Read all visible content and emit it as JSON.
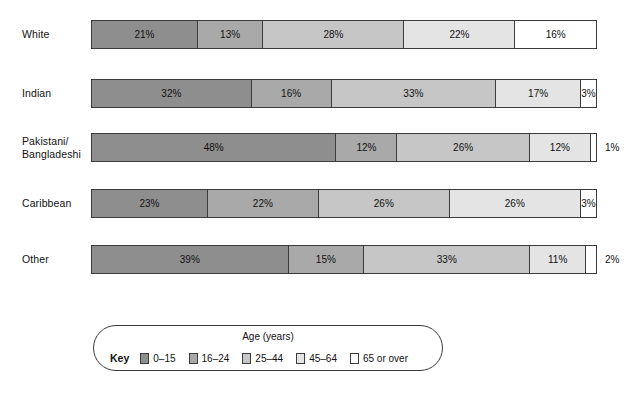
{
  "chart_data": {
    "type": "bar",
    "subtype": "100% stacked horizontal bar",
    "title": "",
    "xlabel": "",
    "ylabel": "",
    "xlim": [
      0,
      100
    ],
    "grid": false,
    "legend_position": "bottom",
    "categories": [
      "White",
      "Indian",
      "Pakistani/ Bangladeshi",
      "Caribbean",
      "Other"
    ],
    "series": [
      {
        "name": "0–15",
        "values": [
          21,
          32,
          48,
          23,
          39
        ]
      },
      {
        "name": "16–24",
        "values": [
          13,
          16,
          12,
          22,
          15
        ]
      },
      {
        "name": "25–44",
        "values": [
          28,
          33,
          26,
          26,
          33
        ]
      },
      {
        "name": "45–64",
        "values": [
          22,
          17,
          12,
          26,
          11
        ]
      },
      {
        "name": "65 or over",
        "values": [
          16,
          3,
          1,
          3,
          2
        ]
      }
    ],
    "colors": [
      "#8e8e8e",
      "#a9a9a9",
      "#c6c6c6",
      "#e4e4e4",
      "#ffffff"
    ]
  },
  "rows": [
    {
      "label_lines": [
        "White"
      ],
      "segments": [
        {
          "value": 21,
          "text": "21%",
          "shade": 0,
          "label_outside": false
        },
        {
          "value": 13,
          "text": "13%",
          "shade": 1,
          "label_outside": false
        },
        {
          "value": 28,
          "text": "28%",
          "shade": 2,
          "label_outside": false
        },
        {
          "value": 22,
          "text": "22%",
          "shade": 3,
          "label_outside": false
        },
        {
          "value": 16,
          "text": "16%",
          "shade": 4,
          "label_outside": false
        }
      ]
    },
    {
      "label_lines": [
        "Indian"
      ],
      "segments": [
        {
          "value": 32,
          "text": "32%",
          "shade": 0,
          "label_outside": false
        },
        {
          "value": 16,
          "text": "16%",
          "shade": 1,
          "label_outside": false
        },
        {
          "value": 33,
          "text": "33%",
          "shade": 2,
          "label_outside": false
        },
        {
          "value": 17,
          "text": "17%",
          "shade": 3,
          "label_outside": false
        },
        {
          "value": 3,
          "text": "3%",
          "shade": 4,
          "label_outside": false
        }
      ]
    },
    {
      "label_lines": [
        "Pakistani/",
        "Bangladeshi"
      ],
      "segments": [
        {
          "value": 48,
          "text": "48%",
          "shade": 0,
          "label_outside": false
        },
        {
          "value": 12,
          "text": "12%",
          "shade": 1,
          "label_outside": false
        },
        {
          "value": 26,
          "text": "26%",
          "shade": 2,
          "label_outside": false
        },
        {
          "value": 12,
          "text": "12%",
          "shade": 3,
          "label_outside": false
        },
        {
          "value": 1,
          "text": "1%",
          "shade": 4,
          "label_outside": true
        }
      ]
    },
    {
      "label_lines": [
        "Caribbean"
      ],
      "segments": [
        {
          "value": 23,
          "text": "23%",
          "shade": 0,
          "label_outside": false
        },
        {
          "value": 22,
          "text": "22%",
          "shade": 1,
          "label_outside": false
        },
        {
          "value": 26,
          "text": "26%",
          "shade": 2,
          "label_outside": false
        },
        {
          "value": 26,
          "text": "26%",
          "shade": 3,
          "label_outside": false
        },
        {
          "value": 3,
          "text": "3%",
          "shade": 4,
          "label_outside": false
        }
      ]
    },
    {
      "label_lines": [
        "Other"
      ],
      "segments": [
        {
          "value": 39,
          "text": "39%",
          "shade": 0,
          "label_outside": false
        },
        {
          "value": 15,
          "text": "15%",
          "shade": 1,
          "label_outside": false
        },
        {
          "value": 33,
          "text": "33%",
          "shade": 2,
          "label_outside": false
        },
        {
          "value": 11,
          "text": "11%",
          "shade": 3,
          "label_outside": false
        },
        {
          "value": 2,
          "text": "2%",
          "shade": 4,
          "label_outside": true
        }
      ]
    }
  ],
  "legend": {
    "key_label": "Key",
    "title": "Age (years)",
    "items": [
      {
        "label": "0–15",
        "shade": 0
      },
      {
        "label": "16–24",
        "shade": 1
      },
      {
        "label": "25–44",
        "shade": 2
      },
      {
        "label": "45–64",
        "shade": 3
      },
      {
        "label": "65 or over",
        "shade": 4
      }
    ]
  },
  "layout": {
    "bar_left": 91,
    "bar_width": 506,
    "row_height": 29,
    "row_tops": [
      20,
      79,
      133,
      189,
      245
    ]
  }
}
